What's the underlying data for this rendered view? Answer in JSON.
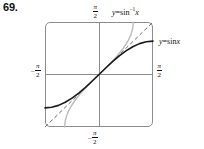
{
  "figure": {
    "problem_number": "69.",
    "background_color": "#ffffff",
    "frame_color": "#8d8d8d",
    "axis_color": "#8d8d8d"
  },
  "axis_labels": {
    "top": {
      "sign": "",
      "numerator": "π",
      "denominator": "2",
      "value": "π/2"
    },
    "right": {
      "sign": "",
      "numerator": "π",
      "denominator": "2",
      "value": "π/2"
    },
    "left": {
      "sign": "–",
      "numerator": "π",
      "denominator": "2",
      "value": "-π/2"
    },
    "bottom": {
      "sign": "–",
      "numerator": "π",
      "denominator": "2",
      "value": "-π/2"
    }
  },
  "curve_labels": {
    "arcsin": {
      "lhs": "y",
      "eq": "=",
      "fn": "sin",
      "exp": "−1",
      "arg": "x",
      "full": "y = sin⁻¹ x"
    },
    "sin": {
      "lhs": "y",
      "eq": "=",
      "fn": "sin",
      "exp": "",
      "arg": "x",
      "full": "y = sin x"
    }
  },
  "chart_data": {
    "type": "line",
    "title": "",
    "xlabel": "",
    "ylabel": "",
    "xlim": [
      -1.5708,
      1.5708
    ],
    "ylim": [
      -1.5708,
      1.5708
    ],
    "grid": false,
    "legend": "inline-annotations",
    "xticks": [
      "-π/2",
      "π/2"
    ],
    "yticks": [
      "-π/2",
      "π/2"
    ],
    "series": [
      {
        "name": "y = sin x",
        "style": "solid",
        "color": "#1a1a1a",
        "width": 1.6,
        "x": [
          -1.5708,
          -1.3744,
          -1.1781,
          -0.9817,
          -0.7854,
          -0.589,
          -0.3927,
          -0.1963,
          0,
          0.1963,
          0.3927,
          0.589,
          0.7854,
          0.9817,
          1.1781,
          1.3744,
          1.5708
        ],
        "y": [
          -1,
          -0.9808,
          -0.9239,
          -0.8315,
          -0.7071,
          -0.5556,
          -0.3827,
          -0.1951,
          0,
          0.1951,
          0.3827,
          0.5556,
          0.7071,
          0.8315,
          0.9239,
          0.9808,
          1
        ]
      },
      {
        "name": "y = sin⁻¹ x",
        "style": "solid",
        "color": "#bdbdbd",
        "width": 1.4,
        "x": [
          -1,
          -0.9808,
          -0.9239,
          -0.8315,
          -0.7071,
          -0.5556,
          -0.3827,
          -0.1951,
          0,
          0.1951,
          0.3827,
          0.5556,
          0.7071,
          0.8315,
          0.9239,
          0.9808,
          1
        ],
        "y": [
          -1.5708,
          -1.3744,
          -1.1781,
          -0.9817,
          -0.7854,
          -0.589,
          -0.3927,
          -0.1963,
          0,
          0.1963,
          0.3927,
          0.589,
          0.7854,
          0.9817,
          1.1781,
          1.3744,
          1.5708
        ]
      },
      {
        "name": "y = x",
        "style": "dashed",
        "color": "#6b6b6b",
        "width": 1.0,
        "x": [
          -1.5708,
          1.5708
        ],
        "y": [
          -1.5708,
          1.5708
        ]
      }
    ],
    "annotations": [
      {
        "text": "y = sin⁻¹ x",
        "position": "top-right-outside"
      },
      {
        "text": "y = sin x",
        "position": "right-outside"
      }
    ]
  }
}
